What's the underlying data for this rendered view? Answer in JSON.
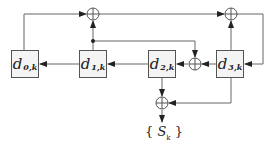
{
  "diagram": {
    "title": "",
    "registers": [
      {
        "id": "d0",
        "label": "d",
        "sub": "0,k"
      },
      {
        "id": "d1",
        "label": "d",
        "sub": "1,k"
      },
      {
        "id": "d2",
        "label": "d",
        "sub": "2,k"
      },
      {
        "id": "d3",
        "label": "d",
        "sub": "3,k"
      }
    ],
    "adders": [
      "top-left-adder",
      "top-right-adder",
      "middle-adder",
      "output-adder"
    ],
    "output": {
      "open": "{",
      "symbol": "S",
      "sub": "k",
      "close": "}"
    },
    "colors": {
      "line": "#555555",
      "box_fill": "#f4f4f4"
    }
  }
}
